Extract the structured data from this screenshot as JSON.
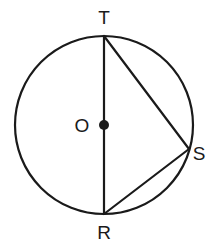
{
  "diagram": {
    "type": "circle-geometry",
    "colors": {
      "stroke": "#1a1a1a",
      "background": "#ffffff"
    },
    "circle": {
      "center_label": "O",
      "cx": 104,
      "cy": 125,
      "r": 89
    },
    "points": {
      "T": {
        "label": "T",
        "x": 104,
        "y": 36
      },
      "R": {
        "label": "R",
        "x": 104,
        "y": 214
      },
      "S": {
        "label": "S",
        "x": 189,
        "y": 149
      },
      "O": {
        "label": "O",
        "x": 104,
        "y": 125
      }
    },
    "segments": [
      {
        "from": "T",
        "to": "R",
        "note": "diameter through O"
      },
      {
        "from": "T",
        "to": "S"
      },
      {
        "from": "S",
        "to": "R"
      }
    ]
  }
}
